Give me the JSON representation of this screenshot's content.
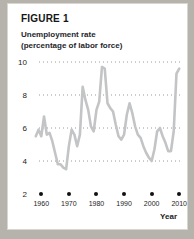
{
  "figure": {
    "label": "FIGURE 1",
    "subtitle_line1": "Unemployment rate",
    "subtitle_line2": "(percentage of labor force)"
  },
  "colors": {
    "card_background": "#ffffff",
    "page_background": "#b5b3ac",
    "line": "#c3c4c6",
    "gridline": "#9a9a9a",
    "text": "#1c1c1c"
  },
  "chart_data": {
    "type": "line",
    "title": "Unemployment rate",
    "subtitle": "(percentage of labor force)",
    "xlabel": "Year",
    "ylabel": "",
    "xlim": [
      1957,
      2011
    ],
    "ylim": [
      2,
      10
    ],
    "grid": true,
    "grid_style": "dotted-horizontal",
    "legend": "none",
    "yticks": [
      10,
      8,
      6,
      4,
      2
    ],
    "ytick_labels": [
      "10",
      "8",
      "6",
      "4",
      "2"
    ],
    "xticks": [
      1960,
      1970,
      1980,
      1990,
      2000,
      2010
    ],
    "xtick_labels": [
      "1960",
      "1970",
      "1980",
      "1990",
      "2000",
      "2010"
    ],
    "xtick_marker": "filled-circle",
    "series": [
      {
        "name": "Unemployment rate",
        "x": [
          1958,
          1959,
          1960,
          1961,
          1962,
          1963,
          1964,
          1965,
          1966,
          1967,
          1968,
          1969,
          1970,
          1971,
          1972,
          1973,
          1974,
          1975,
          1976,
          1977,
          1978,
          1979,
          1980,
          1981,
          1982,
          1983,
          1984,
          1985,
          1986,
          1987,
          1988,
          1989,
          1990,
          1991,
          1992,
          1993,
          1994,
          1995,
          1996,
          1997,
          1998,
          1999,
          2000,
          2001,
          2002,
          2003,
          2004,
          2005,
          2006,
          2007,
          2008,
          2009,
          2010
        ],
        "values": [
          5.5,
          5.9,
          5.5,
          6.7,
          5.6,
          5.7,
          5.2,
          4.5,
          3.8,
          3.8,
          3.6,
          3.5,
          4.9,
          5.9,
          5.6,
          4.9,
          5.6,
          8.5,
          7.7,
          7.1,
          6.1,
          5.8,
          7.1,
          7.6,
          9.7,
          9.6,
          7.5,
          7.2,
          7.0,
          6.2,
          5.5,
          5.3,
          5.6,
          6.8,
          7.5,
          6.9,
          6.1,
          5.6,
          5.4,
          4.9,
          4.5,
          4.2,
          4.0,
          4.7,
          5.8,
          6.0,
          5.5,
          5.1,
          4.6,
          4.6,
          5.8,
          9.3,
          9.6
        ]
      }
    ]
  }
}
